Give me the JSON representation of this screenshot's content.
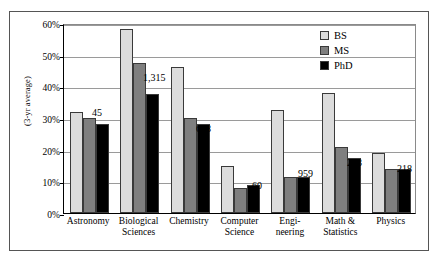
{
  "chart_data": {
    "type": "bar",
    "title": "",
    "xlabel": "",
    "ylabel": "(3-yr average)",
    "ylim": [
      0,
      60
    ],
    "ytick_labels": [
      "0%",
      "10%",
      "20%",
      "30%",
      "40%",
      "50%",
      "60%"
    ],
    "ytick_values": [
      0,
      10,
      20,
      30,
      40,
      50,
      60
    ],
    "grid": true,
    "legend_position": "top-right",
    "categories": [
      "Astronomy",
      "Biological\nSciences",
      "Chemistry",
      "Computer\nScience",
      "Engi-\nneering",
      "Math &\nStatistics",
      "Physics"
    ],
    "series": [
      {
        "name": "BS",
        "color": "#dcdcdc",
        "values": [
          32.0,
          58.0,
          46.0,
          15.0,
          32.5,
          38.0,
          19.0
        ]
      },
      {
        "name": "MS",
        "color": "#7f7f7f",
        "values": [
          30.0,
          47.5,
          30.0,
          8.0,
          11.5,
          21.0,
          14.0
        ]
      },
      {
        "name": "PhD",
        "color": "#000000",
        "values": [
          28.0,
          37.5,
          28.0,
          9.0,
          11.5,
          17.5,
          14.0
        ]
      }
    ],
    "annotations": [
      {
        "text": "45",
        "category": "Astronomy",
        "x_px": 92,
        "y_px": 107
      },
      {
        "text": "1,315",
        "category": "Biological Sciences",
        "x_px": 143,
        "y_px": 72
      },
      {
        "text": "658",
        "category": "Chemistry",
        "x_px": 196,
        "y_px": 123
      },
      {
        "text": "60",
        "category": "Computer Science",
        "x_px": 252,
        "y_px": 180
      },
      {
        "text": "959",
        "category": "Engineering",
        "x_px": 298,
        "y_px": 168
      },
      {
        "text": "243",
        "category": "Math & Statistics",
        "x_px": 347,
        "y_px": 157
      },
      {
        "text": "218",
        "category": "Physics",
        "x_px": 397,
        "y_px": 163
      }
    ]
  }
}
